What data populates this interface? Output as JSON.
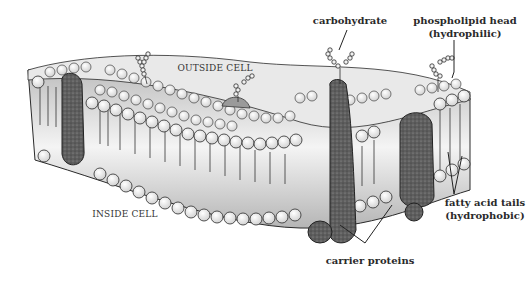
{
  "diagram": {
    "regions": {
      "outside": "OUTSIDE CELL",
      "inside": "INSIDE CELL"
    },
    "labels": {
      "carbohydrate": "carbohydrate",
      "phospholipid_head_line1": "phospholipid head",
      "phospholipid_head_line2": "(hydrophilic)",
      "fatty_acid_tails_line1": "fatty acid tails",
      "fatty_acid_tails_line2": "(hydrophobic)",
      "carrier_proteins": "carrier proteins"
    },
    "colors": {
      "head_fill": "#f2f2f2",
      "outline": "#2a2a2a",
      "protein_fill": "#6b6b6b",
      "glycoprotein_fill": "#9a9a9a",
      "tail_band": "#d8d8d8"
    }
  }
}
